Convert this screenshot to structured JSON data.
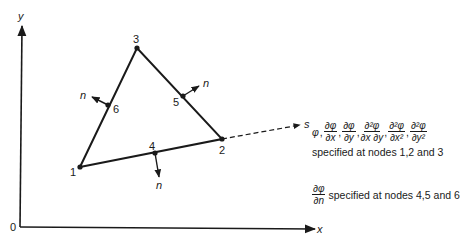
{
  "axes": {
    "origin_label": "0",
    "x_label": "x",
    "y_label": "y"
  },
  "nodes": [
    {
      "id": "1",
      "label": "1",
      "x": 80,
      "y": 167
    },
    {
      "id": "2",
      "label": "2",
      "x": 222,
      "y": 139
    },
    {
      "id": "3",
      "label": "3",
      "x": 137,
      "y": 48
    },
    {
      "id": "4",
      "label": "4",
      "x": 155,
      "y": 153
    },
    {
      "id": "5",
      "label": "5",
      "x": 183,
      "y": 96
    },
    {
      "id": "6",
      "label": "6",
      "x": 108,
      "y": 105
    }
  ],
  "normals": [
    {
      "at_node": "4",
      "label": "n"
    },
    {
      "at_node": "5",
      "label": "n"
    },
    {
      "at_node": "6",
      "label": "n"
    }
  ],
  "tangent_axis_label": "s",
  "annotation": {
    "vertex_dofs": {
      "phi": "φ",
      "d_phi": "∂φ",
      "d_x": "∂x",
      "d_y": "∂y",
      "d2_phi": "∂²φ",
      "d_x_d_y": "∂x ∂y",
      "d_x2": "∂x²",
      "d_y2": "∂y²",
      "text": "specified at nodes 1,2 and 3"
    },
    "midside_dofs": {
      "d_phi": "∂φ",
      "d_n": "∂n",
      "text": "specified at nodes 4,5 and 6"
    }
  },
  "colors": {
    "ink": "#1a1a1a",
    "background": "#ffffff"
  }
}
